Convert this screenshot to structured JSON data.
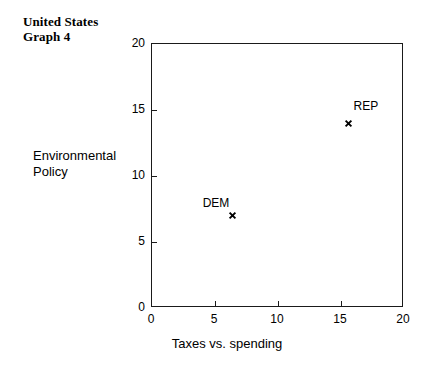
{
  "chart_data": {
    "type": "scatter",
    "title": "United States Graph 4",
    "title_line1": "United States",
    "title_line2": "Graph 4",
    "xlabel": "Taxes vs. spending",
    "ylabel": "Environmental Policy",
    "ylabel_line1": "Environmental",
    "ylabel_line2": "Policy",
    "xlim": [
      0,
      20
    ],
    "ylim": [
      0,
      20
    ],
    "xticks": [
      0,
      5,
      10,
      15,
      20
    ],
    "yticks": [
      0,
      5,
      10,
      15,
      20
    ],
    "xtick_labels": [
      "0",
      "5",
      "10",
      "15",
      "20"
    ],
    "ytick_labels": [
      "0",
      "5",
      "10",
      "15",
      "20"
    ],
    "grid": false,
    "legend": "none",
    "marker": "x",
    "marker_color": "#000000",
    "points": [
      {
        "label": "DEM",
        "x": 6.4,
        "y": 7.0,
        "label_dx": -30,
        "label_dy": -20
      },
      {
        "label": "REP",
        "x": 15.6,
        "y": 14.0,
        "label_dx": 5,
        "label_dy": -24
      }
    ]
  },
  "colors": {
    "background": "#ffffff",
    "axis": "#1a1a1a",
    "text": "#000000"
  }
}
